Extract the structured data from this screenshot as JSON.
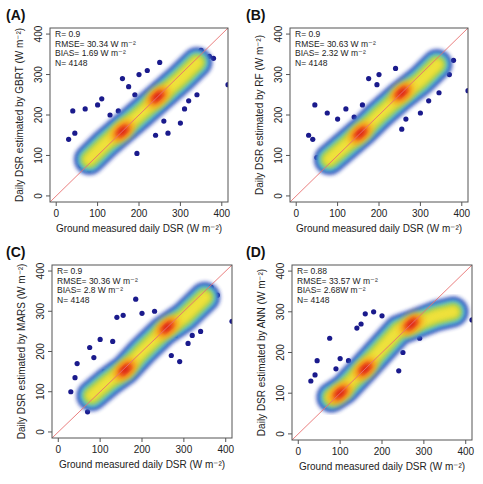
{
  "figure": {
    "width": 483,
    "height": 484,
    "colors": {
      "axis": "#555555",
      "text": "#222222",
      "identity_line": "#e87070",
      "outlier_point": "#1a1a8c",
      "density_scale": [
        "#2b3bb0",
        "#3f8fd6",
        "#5fc0d8",
        "#8ccf6a",
        "#c8d43a",
        "#f2e23a",
        "#f7a21d",
        "#ef5a1b",
        "#d91e14"
      ]
    }
  },
  "chart_data": [
    {
      "panel": "(A)",
      "type": "scatter",
      "model": "GBRT",
      "xlabel": "Ground measured daily DSR (W m⁻²)",
      "ylabel": "Daily DSR estimated by GBRT  (W m⁻²)",
      "xlim": [
        -15,
        415
      ],
      "ylim": [
        -15,
        415
      ],
      "xticks": [
        0,
        100,
        200,
        300,
        400
      ],
      "yticks": [
        0,
        100,
        200,
        300,
        400
      ],
      "grid": false,
      "reference_line": "1:1",
      "stats": {
        "R": "R= 0.9",
        "RMSE": "RMSE= 30.34 W m⁻²",
        "BIAS": "BIAS= 1.69 W m⁻²",
        "N": "N= 4148"
      },
      "density_ridge": [
        [
          80,
          90
        ],
        [
          120,
          130
        ],
        [
          160,
          165
        ],
        [
          200,
          200
        ],
        [
          250,
          245
        ],
        [
          300,
          290
        ],
        [
          340,
          330
        ]
      ],
      "hotspots": [
        [
          160,
          160
        ],
        [
          245,
          245
        ]
      ],
      "outliers": [
        [
          30,
          140
        ],
        [
          40,
          210
        ],
        [
          45,
          155
        ],
        [
          60,
          75
        ],
        [
          70,
          215
        ],
        [
          80,
          65
        ],
        [
          100,
          225
        ],
        [
          110,
          240
        ],
        [
          130,
          200
        ],
        [
          140,
          165
        ],
        [
          150,
          210
        ],
        [
          160,
          290
        ],
        [
          175,
          270
        ],
        [
          190,
          250
        ],
        [
          195,
          105
        ],
        [
          200,
          300
        ],
        [
          220,
          310
        ],
        [
          240,
          150
        ],
        [
          250,
          330
        ],
        [
          260,
          185
        ],
        [
          270,
          155
        ],
        [
          300,
          180
        ],
        [
          310,
          215
        ],
        [
          320,
          235
        ],
        [
          340,
          250
        ],
        [
          350,
          360
        ],
        [
          360,
          340
        ],
        [
          370,
          345
        ],
        [
          380,
          340
        ],
        [
          415,
          275
        ]
      ]
    },
    {
      "panel": "(B)",
      "type": "scatter",
      "model": "RF",
      "xlabel": "Ground measured daily DSR (W m⁻²)",
      "ylabel": "Daily DSR estimated by RF  (W m⁻²)",
      "xlim": [
        -15,
        415
      ],
      "ylim": [
        -15,
        415
      ],
      "xticks": [
        0,
        100,
        200,
        300,
        400
      ],
      "yticks": [
        0,
        100,
        200,
        300,
        400
      ],
      "grid": false,
      "reference_line": "1:1",
      "stats": {
        "R": "R= 0.9",
        "RMSE": "RMSE= 30.63 W m⁻²",
        "BIAS": "BIAS= 2.32 W m⁻²",
        "N": "N= 4148"
      },
      "density_ridge": [
        [
          80,
          90
        ],
        [
          120,
          125
        ],
        [
          160,
          160
        ],
        [
          200,
          200
        ],
        [
          250,
          245
        ],
        [
          300,
          285
        ],
        [
          340,
          325
        ]
      ],
      "hotspots": [
        [
          155,
          155
        ],
        [
          255,
          255
        ]
      ],
      "outliers": [
        [
          30,
          150
        ],
        [
          40,
          140
        ],
        [
          45,
          225
        ],
        [
          50,
          95
        ],
        [
          75,
          205
        ],
        [
          90,
          70
        ],
        [
          100,
          190
        ],
        [
          120,
          215
        ],
        [
          140,
          195
        ],
        [
          160,
          225
        ],
        [
          175,
          290
        ],
        [
          195,
          275
        ],
        [
          200,
          300
        ],
        [
          210,
          230
        ],
        [
          240,
          315
        ],
        [
          255,
          165
        ],
        [
          265,
          190
        ],
        [
          300,
          205
        ],
        [
          320,
          235
        ],
        [
          330,
          345
        ],
        [
          345,
          255
        ],
        [
          370,
          300
        ],
        [
          380,
          335
        ],
        [
          415,
          260
        ]
      ]
    },
    {
      "panel": "(C)",
      "type": "scatter",
      "model": "MARS",
      "xlabel": "Ground measured daily DSR (W m⁻²)",
      "ylabel": "Daily DSR estimated by MARS  (W m⁻²)",
      "xlim": [
        -15,
        415
      ],
      "ylim": [
        -15,
        415
      ],
      "xticks": [
        0,
        100,
        200,
        300,
        400
      ],
      "yticks": [
        0,
        100,
        200,
        300,
        400
      ],
      "grid": false,
      "reference_line": "1:1",
      "stats": {
        "R": "R= 0.9",
        "RMSE": "RMSE= 30.36 W m⁻²",
        "BIAS": "BIAS= 2.8 W m⁻²",
        "N": "N= 4148"
      },
      "density_ridge": [
        [
          80,
          90
        ],
        [
          120,
          125
        ],
        [
          160,
          155
        ],
        [
          200,
          200
        ],
        [
          250,
          250
        ],
        [
          300,
          285
        ],
        [
          350,
          335
        ]
      ],
      "hotspots": [
        [
          160,
          155
        ],
        [
          260,
          260
        ]
      ],
      "outliers": [
        [
          30,
          100
        ],
        [
          40,
          135
        ],
        [
          45,
          170
        ],
        [
          60,
          80
        ],
        [
          70,
          50
        ],
        [
          75,
          210
        ],
        [
          85,
          185
        ],
        [
          100,
          230
        ],
        [
          110,
          150
        ],
        [
          130,
          225
        ],
        [
          140,
          285
        ],
        [
          155,
          290
        ],
        [
          185,
          330
        ],
        [
          200,
          295
        ],
        [
          230,
          300
        ],
        [
          270,
          190
        ],
        [
          280,
          240
        ],
        [
          290,
          175
        ],
        [
          310,
          220
        ],
        [
          320,
          240
        ],
        [
          340,
          250
        ],
        [
          350,
          355
        ],
        [
          365,
          360
        ],
        [
          380,
          340
        ],
        [
          415,
          275
        ]
      ]
    },
    {
      "panel": "(D)",
      "type": "scatter",
      "model": "ANN",
      "xlabel": "Ground measured daily DSR (W m⁻²)",
      "ylabel": "Daily DSR estimated by ANN  (W m⁻²)",
      "xlim": [
        -15,
        415
      ],
      "ylim": [
        -15,
        415
      ],
      "xticks": [
        0,
        100,
        200,
        300,
        400
      ],
      "yticks": [
        0,
        100,
        200,
        300,
        400
      ],
      "grid": false,
      "reference_line": "1:1",
      "stats": {
        "R": "R= 0.88",
        "RMSE": "RMSE= 33.57 W m⁻²",
        "BIAS": "BIAS= 2.68W m⁻²",
        "N": "N= 4148"
      },
      "density_ridge": [
        [
          80,
          90
        ],
        [
          110,
          110
        ],
        [
          160,
          165
        ],
        [
          200,
          210
        ],
        [
          240,
          255
        ],
        [
          280,
          270
        ],
        [
          330,
          290
        ],
        [
          370,
          300
        ]
      ],
      "hotspots": [
        [
          160,
          160
        ],
        [
          270,
          270
        ],
        [
          100,
          100
        ]
      ],
      "outliers": [
        [
          30,
          130
        ],
        [
          40,
          145
        ],
        [
          45,
          180
        ],
        [
          60,
          90
        ],
        [
          75,
          235
        ],
        [
          90,
          160
        ],
        [
          100,
          185
        ],
        [
          120,
          180
        ],
        [
          140,
          260
        ],
        [
          150,
          270
        ],
        [
          160,
          295
        ],
        [
          180,
          300
        ],
        [
          200,
          290
        ],
        [
          240,
          155
        ],
        [
          250,
          200
        ],
        [
          290,
          235
        ],
        [
          330,
          305
        ],
        [
          370,
          315
        ],
        [
          380,
          300
        ],
        [
          415,
          280
        ]
      ]
    }
  ],
  "panels_layout": [
    {
      "label_x": 6,
      "label_y": 20,
      "box": [
        50,
        28,
        178,
        174
      ]
    },
    {
      "label_x": 246,
      "label_y": 20,
      "box": [
        290,
        28,
        178,
        174
      ]
    },
    {
      "label_x": 6,
      "label_y": 257,
      "box": [
        52,
        265,
        180,
        173
      ]
    },
    {
      "label_x": 246,
      "label_y": 257,
      "box": [
        292,
        265,
        180,
        175
      ]
    }
  ]
}
